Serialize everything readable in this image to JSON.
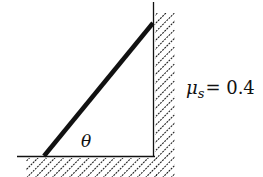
{
  "diagram": {
    "angle_label": "θ",
    "mu_symbol": "μ",
    "mu_subscript": "s",
    "mu_equals": "= 0.4"
  }
}
